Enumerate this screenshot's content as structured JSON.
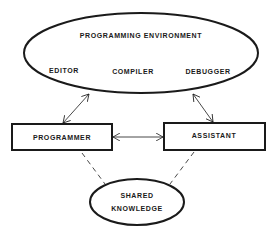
{
  "diagram": {
    "environment": {
      "title": "PROGRAMMING ENVIRONMENT",
      "components": [
        "EDITOR",
        "COMPILER",
        "DEBUGGER"
      ]
    },
    "programmer": {
      "label": "PROGRAMMER"
    },
    "assistant": {
      "label": "ASSISTANT"
    },
    "shared_knowledge": {
      "line1": "SHARED",
      "line2": "KNOWLEDGE"
    },
    "connections": [
      {
        "from": "programming-environment",
        "to": "programmer",
        "style": "solid",
        "direction": "bidirectional"
      },
      {
        "from": "programming-environment",
        "to": "assistant",
        "style": "solid",
        "direction": "bidirectional"
      },
      {
        "from": "programmer",
        "to": "assistant",
        "style": "solid",
        "direction": "bidirectional"
      },
      {
        "from": "programmer",
        "to": "shared-knowledge",
        "style": "dashed",
        "direction": "none"
      },
      {
        "from": "assistant",
        "to": "shared-knowledge",
        "style": "dashed",
        "direction": "none"
      }
    ],
    "colors": {
      "stroke": "#1a1a1a",
      "background": "#ffffff"
    }
  }
}
